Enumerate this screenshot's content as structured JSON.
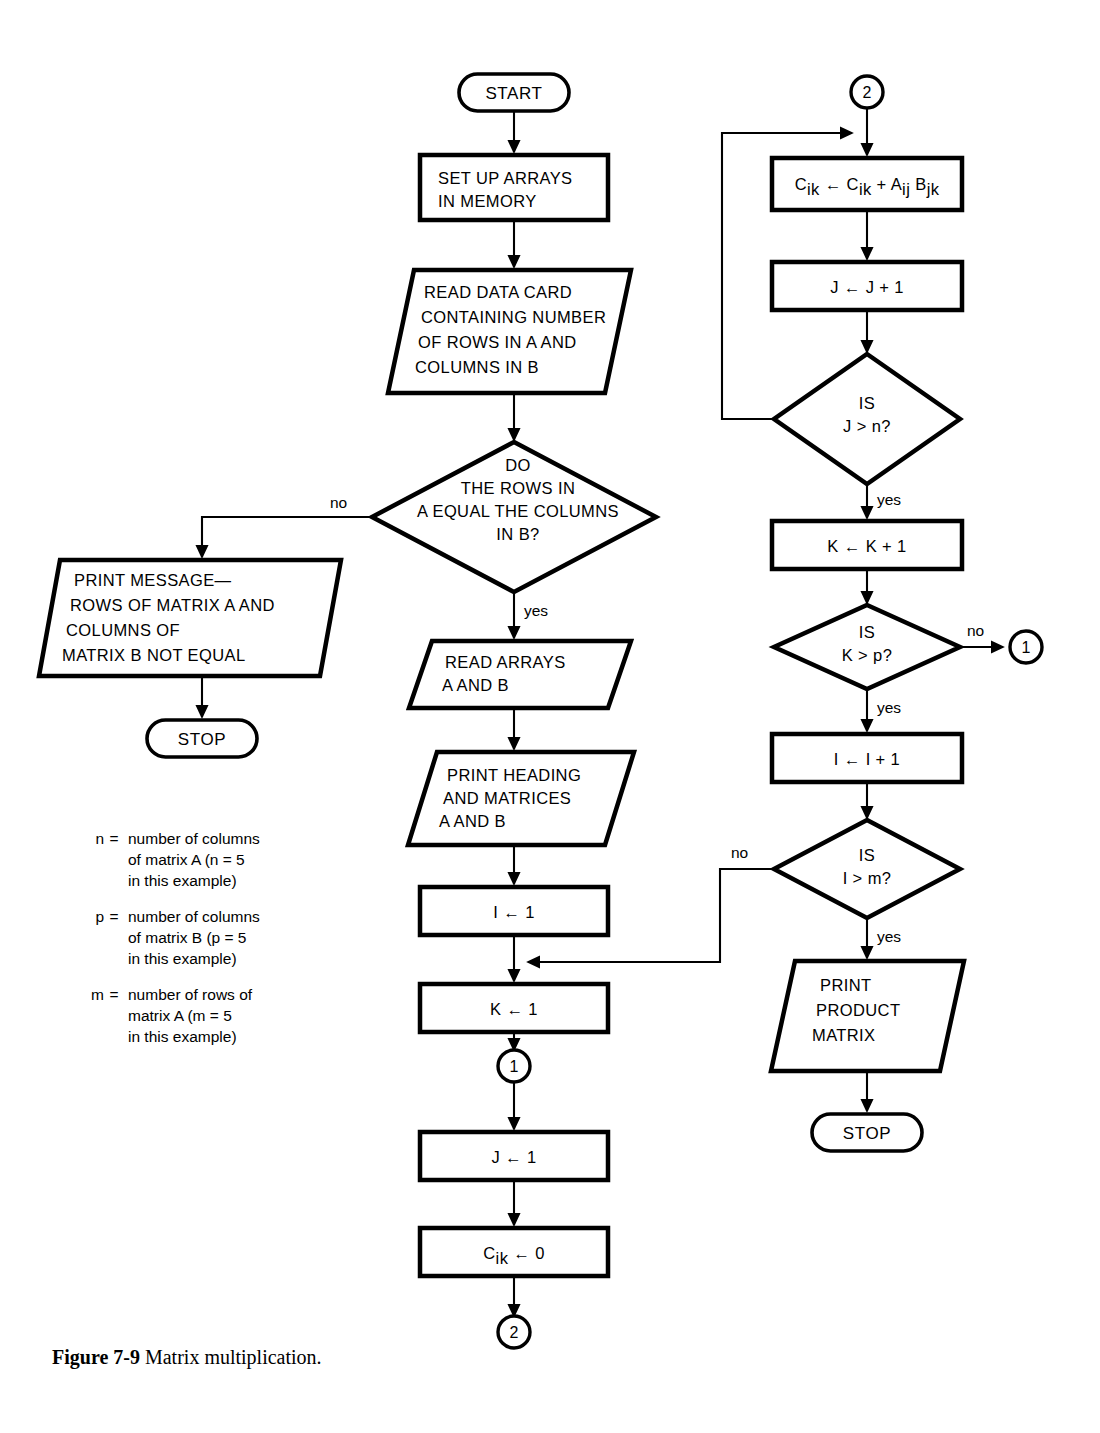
{
  "figure": {
    "caption_label": "Figure 7-9",
    "caption_text": "Matrix multiplication."
  },
  "nodes": {
    "start": {
      "type": "terminator",
      "label": "START"
    },
    "setup": {
      "type": "process",
      "line1": "SET UP ARRAYS",
      "line2": "IN MEMORY"
    },
    "read_card": {
      "type": "io",
      "line1": "READ DATA CARD",
      "line2": "CONTAINING NUMBER",
      "line3": "OF ROWS IN A AND",
      "line4": "COLUMNS IN B"
    },
    "decide_dims": {
      "type": "decision",
      "line1": "DO",
      "line2": "THE ROWS IN",
      "line3": "A EQUAL THE COLUMNS",
      "line4": "IN B?",
      "yes_label": "yes",
      "no_label": "no"
    },
    "print_message": {
      "type": "io",
      "line1": "PRINT MESSAGE—",
      "line2": "ROWS OF MATRIX A AND",
      "line3": "COLUMNS OF",
      "line4": "MATRIX B NOT EQUAL"
    },
    "stop_left": {
      "type": "terminator",
      "label": "STOP"
    },
    "read_arrays": {
      "type": "io",
      "line1": "READ ARRAYS",
      "line2": "A AND B"
    },
    "print_heading": {
      "type": "io",
      "line1": "PRINT HEADING",
      "line2": "AND MATRICES",
      "line3": "A AND B"
    },
    "init_i": {
      "type": "process",
      "label": "I ← 1"
    },
    "init_k": {
      "type": "process",
      "label": "K ← 1"
    },
    "conn_1_mid": {
      "type": "connector",
      "label": "1"
    },
    "init_j": {
      "type": "process",
      "label": "J ← 1"
    },
    "init_cik": {
      "type": "process",
      "label_pre": "C",
      "label_sub": "ik",
      "label_post": " ← 0"
    },
    "conn_2_bottom": {
      "type": "connector",
      "label": "2"
    },
    "conn_2_top": {
      "type": "connector",
      "label": "2"
    },
    "accumulate": {
      "type": "process",
      "seg1": "C",
      "sub1": "ik",
      "seg2": " ← C",
      "sub2": "ik",
      "seg3": " + A",
      "sub3": "ij",
      "seg4": " B",
      "sub4": "jk"
    },
    "incr_j": {
      "type": "process",
      "label": "J ← J + 1"
    },
    "decide_j": {
      "type": "decision",
      "line1": "IS",
      "line2": "J > n?",
      "yes_label": "yes",
      "no_label": ""
    },
    "incr_k": {
      "type": "process",
      "label": "K ← K + 1"
    },
    "decide_k": {
      "type": "decision",
      "line1": "IS",
      "line2": "K > p?",
      "yes_label": "yes",
      "no_label": "no"
    },
    "conn_1_right": {
      "type": "connector",
      "label": "1"
    },
    "incr_i": {
      "type": "process",
      "label": "I ← I + 1"
    },
    "decide_i": {
      "type": "decision",
      "line1": "IS",
      "line2": "I > m?",
      "yes_label": "yes",
      "no_label": "no"
    },
    "print_product": {
      "type": "io",
      "line1": "PRINT",
      "line2": "PRODUCT",
      "line3": "MATRIX"
    },
    "stop_right": {
      "type": "terminator",
      "label": "STOP"
    }
  },
  "legend": {
    "items": [
      {
        "symbol": "n",
        "equals": "=",
        "line1": "number of columns",
        "line2": "of matrix A (n = 5",
        "line3": "in this example)"
      },
      {
        "symbol": "p",
        "equals": "=",
        "line1": "number of columns",
        "line2": "of matrix B (p = 5",
        "line3": "in this example)"
      },
      {
        "symbol": "m",
        "equals": "=",
        "line1": "number of rows of",
        "line2": "matrix A (m = 5",
        "line3": "in this example)"
      }
    ]
  },
  "colors": {
    "ink": "#000000",
    "paper": "#ffffff"
  }
}
